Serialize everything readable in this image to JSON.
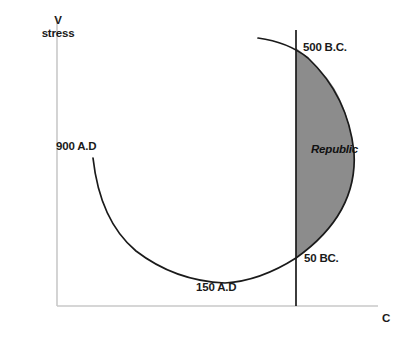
{
  "figure": {
    "axes": {
      "y_axis_label_line1": "V",
      "y_axis_label_line2": "stress",
      "x_axis_label": "C",
      "axis_color": "#c9c9c9"
    },
    "region_label": "Republic",
    "annotations": [
      {
        "name": "point-500-bc",
        "text": "500 B.C."
      },
      {
        "name": "point-900-ad",
        "text": "900 A.D"
      },
      {
        "name": "point-50-bc",
        "text": "50 BC."
      },
      {
        "name": "point-150-ad",
        "text": "150 A.D"
      }
    ]
  },
  "chart_data": {
    "type": "line",
    "title": "",
    "xlabel": "C",
    "ylabel": "V stress",
    "grid": false,
    "legend": null,
    "axis_color": "#c9c9c9",
    "curve_color": "#1a1a1a",
    "shaded_region": {
      "label": "Republic",
      "fill": "#8c8c8c",
      "stroke": "#1a1a1a",
      "description": "Area bounded on the left by the vertical divider line and on the right by the trajectory arc between 500 B.C. and 50 BC."
    },
    "divider_line": {
      "name": "vertical-divider",
      "color": "#1a1a1a",
      "x_px": 296,
      "y_top_px": 30,
      "y_bottom_px": 306
    },
    "trajectory": {
      "name": "roman-stress-trajectory",
      "direction": "from 500 B.C. clockwise through 50 BC., 150 A.D to 900 A.D",
      "labeled_points": [
        {
          "label": "500 B.C.",
          "x_px": 296,
          "y_px": 48
        },
        {
          "label": "50 BC.",
          "x_px": 296,
          "y_px": 258
        },
        {
          "label": "150 A.D",
          "x_px": 225,
          "y_px": 283
        },
        {
          "label": "900 A.D",
          "x_px": 93,
          "y_px": 158
        }
      ],
      "path_px": "M 258 38 Q 290 44 310 60 Q 348 96 354 152 Q 358 214 296 258 Q 258 282 225 283 Q 176 281 136 252 Q 100 222 93 158"
    },
    "axes_geometry": {
      "origin_px": {
        "x": 57,
        "y": 306
      },
      "y_axis_top_px": 18,
      "x_axis_right_px": 378
    }
  }
}
